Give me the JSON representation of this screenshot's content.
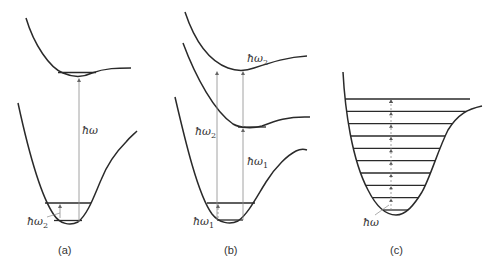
{
  "figure": {
    "panels": [
      {
        "id": "a",
        "caption": "(a)",
        "labels": {
          "main_transition": "ħω",
          "small_transition_base": "ħω",
          "small_transition_sub": "2"
        },
        "ground_state_levels": 2,
        "excited_state_levels": 1
      },
      {
        "id": "b",
        "caption": "(b)",
        "labels": {
          "left_transition_base": "ħω",
          "left_transition_sub": "2",
          "upper_transition_base": "ħω",
          "upper_transition_sub": "2",
          "lower_transition_base": "ħω",
          "lower_transition_sub": "1",
          "small_transition_base": "ħω",
          "small_transition_sub": "1"
        },
        "ground_state_levels": 2,
        "intermediate_state_levels": 1
      },
      {
        "id": "c",
        "caption": "(c)",
        "labels": {
          "ladder_transition": "ħω"
        },
        "ladder_levels": 10
      }
    ]
  }
}
